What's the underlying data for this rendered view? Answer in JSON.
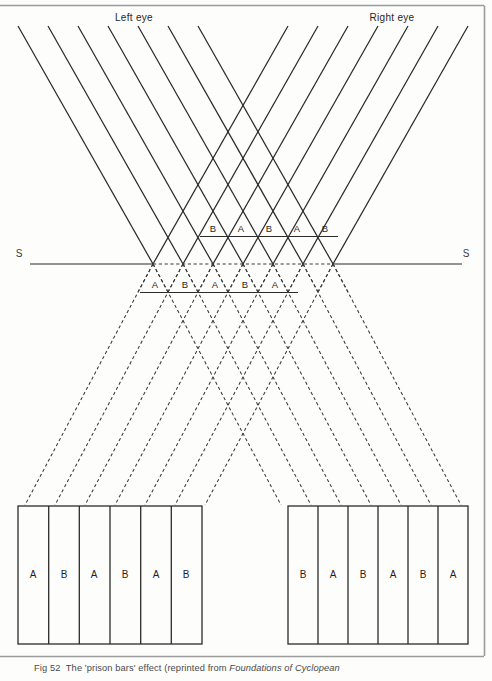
{
  "figure": {
    "id": "prison-bars-figure",
    "top_border_color": "#9b9b9b",
    "right_border_color": "#9b9b9b",
    "line_color": "#2b2b2b",
    "background": "#fdfdfc",
    "eye_labels": {
      "left": "Left eye",
      "right": "Right eye"
    },
    "screen_line": {
      "left_label": "S",
      "right_label": "S"
    },
    "upper_bar_labels": [
      "B",
      "A",
      "B",
      "A",
      "B"
    ],
    "lower_bar_labels": [
      "A",
      "B",
      "A",
      "B",
      "A"
    ],
    "left_panel_labels": [
      "A",
      "B",
      "A",
      "B",
      "A",
      "B"
    ],
    "right_panel_labels": [
      "B",
      "A",
      "B",
      "A",
      "B",
      "A"
    ],
    "ray_counts": {
      "left_eye": 7,
      "right_eye": 7
    }
  },
  "caption": {
    "prefix": "Fig 52",
    "text": "The 'prison bars' effect (reprinted from ",
    "italic": "Foundations of Cyclopean"
  }
}
